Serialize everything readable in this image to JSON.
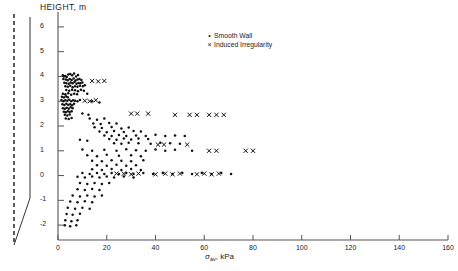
{
  "chart_data": {
    "type": "scatter",
    "title": "",
    "xlabel": "σav, kPa",
    "xlabel_symbol": "σ",
    "xlabel_sub": "av",
    "xlabel_unit": "kPa",
    "ylabel": "HEIGHT, m",
    "xlim": [
      0,
      160
    ],
    "ylim": [
      -2.6,
      6.6
    ],
    "xticks": [
      0,
      20,
      40,
      60,
      80,
      100,
      120,
      140,
      160
    ],
    "yticks": [
      -2,
      -1,
      0,
      1,
      2,
      3,
      4,
      5,
      6
    ],
    "grid": false,
    "legend_position": "top-right",
    "series": [
      {
        "name": "Smooth Wall",
        "marker": "dot",
        "color": "#111111",
        "points": [
          [
            2.0,
            4.05
          ],
          [
            2.4,
            4.0
          ],
          [
            3.0,
            4.02
          ],
          [
            3.6,
            3.98
          ],
          [
            4.2,
            4.08
          ],
          [
            5.0,
            4.1
          ],
          [
            5.8,
            4.05
          ],
          [
            6.6,
            4.12
          ],
          [
            7.4,
            4.0
          ],
          [
            8.2,
            4.06
          ],
          [
            2.2,
            3.9
          ],
          [
            3.2,
            3.88
          ],
          [
            4.0,
            3.85
          ],
          [
            4.8,
            3.9
          ],
          [
            5.6,
            3.86
          ],
          [
            6.4,
            3.92
          ],
          [
            7.2,
            3.84
          ],
          [
            8.0,
            3.88
          ],
          [
            8.8,
            3.9
          ],
          [
            9.6,
            3.86
          ],
          [
            2.6,
            3.75
          ],
          [
            3.4,
            3.72
          ],
          [
            4.4,
            3.7
          ],
          [
            5.2,
            3.76
          ],
          [
            6.0,
            3.72
          ],
          [
            6.8,
            3.78
          ],
          [
            7.6,
            3.7
          ],
          [
            8.4,
            3.74
          ],
          [
            9.2,
            3.72
          ],
          [
            10.0,
            3.76
          ],
          [
            3.0,
            3.6
          ],
          [
            4.0,
            3.58
          ],
          [
            5.0,
            3.62
          ],
          [
            6.0,
            3.56
          ],
          [
            7.0,
            3.6
          ],
          [
            8.0,
            3.58
          ],
          [
            9.0,
            3.62
          ],
          [
            10.2,
            3.6
          ],
          [
            11.0,
            3.64
          ],
          [
            3.4,
            3.45
          ],
          [
            4.6,
            3.42
          ],
          [
            5.8,
            3.46
          ],
          [
            7.0,
            3.44
          ],
          [
            8.2,
            3.4
          ],
          [
            9.4,
            3.46
          ],
          [
            10.6,
            3.42
          ],
          [
            2.0,
            3.3
          ],
          [
            3.0,
            3.28
          ],
          [
            4.2,
            3.32
          ],
          [
            5.4,
            3.26
          ],
          [
            6.6,
            3.3
          ],
          [
            7.8,
            3.28
          ],
          [
            1.6,
            3.18
          ],
          [
            2.4,
            3.15
          ],
          [
            3.2,
            3.2
          ],
          [
            4.0,
            3.16
          ],
          [
            12.0,
            3.3
          ],
          [
            1.4,
            3.05
          ],
          [
            2.2,
            3.0
          ],
          [
            3.0,
            3.04
          ],
          [
            3.8,
            3.02
          ],
          [
            4.6,
            3.06
          ],
          [
            5.4,
            3.0
          ],
          [
            6.2,
            3.04
          ],
          [
            7.0,
            3.02
          ],
          [
            8.0,
            3.0
          ],
          [
            9.0,
            3.05
          ],
          [
            14.0,
            3.0
          ],
          [
            17.0,
            2.95
          ],
          [
            1.8,
            2.88
          ],
          [
            2.6,
            2.85
          ],
          [
            3.4,
            2.9
          ],
          [
            4.2,
            2.86
          ],
          [
            5.0,
            2.88
          ],
          [
            5.8,
            2.84
          ],
          [
            6.6,
            2.9
          ],
          [
            2.0,
            2.72
          ],
          [
            2.8,
            2.7
          ],
          [
            3.6,
            2.74
          ],
          [
            4.4,
            2.7
          ],
          [
            5.2,
            2.76
          ],
          [
            6.0,
            2.72
          ],
          [
            2.4,
            2.58
          ],
          [
            3.2,
            2.55
          ],
          [
            4.0,
            2.6
          ],
          [
            4.8,
            2.56
          ],
          [
            5.6,
            2.6
          ],
          [
            2.8,
            2.45
          ],
          [
            3.8,
            2.42
          ],
          [
            4.8,
            2.46
          ],
          [
            10.0,
            2.5
          ],
          [
            12.5,
            2.45
          ],
          [
            3.2,
            2.3
          ],
          [
            4.4,
            2.28
          ],
          [
            5.6,
            2.32
          ],
          [
            13.0,
            2.3
          ],
          [
            16.0,
            2.25
          ],
          [
            19.0,
            2.3
          ],
          [
            14.5,
            2.1
          ],
          [
            17.5,
            2.08
          ],
          [
            21.0,
            2.12
          ],
          [
            24.0,
            2.1
          ],
          [
            15.0,
            1.95
          ],
          [
            18.0,
            1.92
          ],
          [
            22.0,
            1.96
          ],
          [
            26.0,
            1.9
          ],
          [
            29.0,
            1.94
          ],
          [
            17.0,
            1.78
          ],
          [
            20.0,
            1.75
          ],
          [
            23.0,
            1.8
          ],
          [
            27.0,
            1.76
          ],
          [
            31.0,
            1.8
          ],
          [
            34.0,
            1.78
          ],
          [
            19.0,
            1.62
          ],
          [
            22.0,
            1.6
          ],
          [
            25.0,
            1.64
          ],
          [
            28.0,
            1.6
          ],
          [
            32.0,
            1.62
          ],
          [
            36.0,
            1.6
          ],
          [
            40.0,
            1.65
          ],
          [
            44.0,
            1.6
          ],
          [
            48.0,
            1.62
          ],
          [
            52.0,
            1.6
          ],
          [
            21.0,
            1.48
          ],
          [
            24.0,
            1.45
          ],
          [
            27.0,
            1.5
          ],
          [
            30.0,
            1.46
          ],
          [
            33.0,
            1.5
          ],
          [
            37.0,
            1.48
          ],
          [
            9.0,
            1.45
          ],
          [
            12.0,
            1.4
          ],
          [
            23.0,
            1.3
          ],
          [
            26.0,
            1.28
          ],
          [
            29.0,
            1.32
          ],
          [
            33.0,
            1.3
          ],
          [
            38.0,
            1.28
          ],
          [
            42.0,
            1.32
          ],
          [
            46.0,
            1.3
          ],
          [
            50.0,
            1.28
          ],
          [
            10.0,
            1.05
          ],
          [
            14.0,
            1.0
          ],
          [
            19.0,
            1.04
          ],
          [
            24.0,
            1.0
          ],
          [
            28.0,
            1.06
          ],
          [
            32.0,
            1.02
          ],
          [
            36.0,
            1.0
          ],
          [
            40.0,
            1.05
          ],
          [
            44.0,
            1.0
          ],
          [
            48.0,
            1.04
          ],
          [
            55.0,
            1.0
          ],
          [
            12.0,
            0.82
          ],
          [
            16.0,
            0.78
          ],
          [
            20.0,
            0.84
          ],
          [
            25.0,
            0.8
          ],
          [
            30.0,
            0.82
          ],
          [
            34.0,
            0.78
          ],
          [
            14.0,
            0.6
          ],
          [
            18.0,
            0.58
          ],
          [
            22.0,
            0.62
          ],
          [
            26.0,
            0.6
          ],
          [
            30.0,
            0.58
          ],
          [
            35.0,
            0.62
          ],
          [
            16.0,
            0.42
          ],
          [
            20.0,
            0.4
          ],
          [
            24.0,
            0.44
          ],
          [
            28.0,
            0.4
          ],
          [
            32.0,
            0.42
          ],
          [
            14.0,
            0.25
          ],
          [
            18.0,
            0.22
          ],
          [
            22.0,
            0.26
          ],
          [
            26.0,
            0.22
          ],
          [
            30.0,
            0.26
          ],
          [
            34.0,
            0.22
          ],
          [
            10.0,
            0.1
          ],
          [
            13.0,
            0.06
          ],
          [
            16.0,
            0.1
          ],
          [
            19.0,
            0.06
          ],
          [
            22.0,
            0.1
          ],
          [
            25.0,
            0.06
          ],
          [
            28.0,
            0.1
          ],
          [
            31.0,
            0.06
          ],
          [
            35.0,
            0.1
          ],
          [
            39.0,
            0.06
          ],
          [
            43.0,
            0.1
          ],
          [
            47.0,
            0.06
          ],
          [
            51.0,
            0.1
          ],
          [
            55.0,
            0.06
          ],
          [
            59.0,
            0.1
          ],
          [
            63.0,
            0.06
          ],
          [
            67.0,
            0.1
          ],
          [
            71.0,
            0.06
          ],
          [
            8.0,
            -0.05
          ],
          [
            11.0,
            -0.08
          ],
          [
            14.0,
            -0.04
          ],
          [
            17.0,
            -0.08
          ],
          [
            20.0,
            -0.04
          ],
          [
            23.0,
            -0.08
          ],
          [
            27.0,
            -0.04
          ],
          [
            31.0,
            -0.08
          ],
          [
            9.0,
            -0.3
          ],
          [
            12.0,
            -0.34
          ],
          [
            15.0,
            -0.3
          ],
          [
            18.0,
            -0.34
          ],
          [
            21.0,
            -0.3
          ],
          [
            8.0,
            -0.55
          ],
          [
            11.0,
            -0.58
          ],
          [
            14.0,
            -0.54
          ],
          [
            17.0,
            -0.58
          ],
          [
            6.0,
            -0.8
          ],
          [
            9.0,
            -0.84
          ],
          [
            12.0,
            -0.8
          ],
          [
            15.0,
            -0.84
          ],
          [
            18.0,
            -0.8
          ],
          [
            5.0,
            -1.05
          ],
          [
            8.0,
            -1.08
          ],
          [
            11.0,
            -1.04
          ],
          [
            14.0,
            -1.08
          ],
          [
            4.0,
            -1.3
          ],
          [
            7.0,
            -1.34
          ],
          [
            10.0,
            -1.3
          ],
          [
            13.0,
            -1.34
          ],
          [
            3.5,
            -1.55
          ],
          [
            6.0,
            -1.58
          ],
          [
            9.0,
            -1.54
          ],
          [
            3.0,
            -1.8
          ],
          [
            5.5,
            -1.84
          ],
          [
            8.0,
            -1.8
          ],
          [
            2.8,
            -2.0
          ],
          [
            5.0,
            -2.05
          ],
          [
            7.5,
            -2.0
          ]
        ]
      },
      {
        "name": "Induced Irregularity",
        "marker": "x",
        "color": "#111111",
        "points": [
          [
            14.0,
            3.82
          ],
          [
            16.5,
            3.8
          ],
          [
            19.0,
            3.82
          ],
          [
            11.0,
            3.02
          ],
          [
            13.0,
            3.0
          ],
          [
            15.5,
            3.04
          ],
          [
            30.0,
            2.5
          ],
          [
            32.5,
            2.5
          ],
          [
            37.0,
            2.5
          ],
          [
            48.0,
            2.45
          ],
          [
            54.0,
            2.45
          ],
          [
            57.0,
            2.45
          ],
          [
            62.0,
            2.45
          ],
          [
            65.0,
            2.45
          ],
          [
            68.0,
            2.45
          ],
          [
            41.0,
            1.25
          ],
          [
            43.5,
            1.25
          ],
          [
            53.0,
            1.25
          ],
          [
            62.0,
            1.0
          ],
          [
            65.0,
            1.0
          ],
          [
            77.0,
            1.0
          ],
          [
            80.0,
            1.0
          ],
          [
            24.0,
            0.08
          ],
          [
            27.0,
            0.08
          ],
          [
            30.0,
            0.05
          ],
          [
            33.0,
            0.08
          ],
          [
            40.0,
            0.05
          ],
          [
            44.0,
            0.08
          ],
          [
            47.0,
            0.05
          ],
          [
            50.0,
            0.08
          ],
          [
            57.0,
            0.05
          ],
          [
            60.0,
            0.08
          ],
          [
            63.0,
            0.05
          ],
          [
            66.0,
            0.08
          ]
        ]
      }
    ]
  },
  "legend": {
    "smooth_marker": "•",
    "smooth_label": "Smooth Wall",
    "induced_marker": "×",
    "induced_label": "Induced Irregularity"
  },
  "schematic": {
    "name": "retaining-wall-profile",
    "description": "dashed vertical reference line beside tapered wall profile"
  }
}
